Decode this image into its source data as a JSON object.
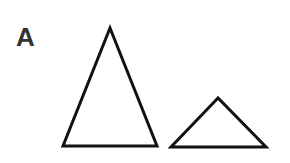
{
  "panel_label": "A",
  "colors": {
    "stroke": "#111111",
    "label": "#333333",
    "background": "#ffffff"
  },
  "shapes": [
    {
      "name": "large-triangle",
      "points": "110,28 63,146 157,146"
    },
    {
      "name": "small-triangle",
      "points": "218,98 171,147 266,147"
    }
  ]
}
